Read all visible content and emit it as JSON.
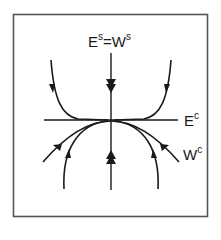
{
  "figure": {
    "type": "phase-portrait",
    "colors": {
      "stroke": "#1a1a1a",
      "frame": "#555555",
      "background": "#ffffff"
    }
  },
  "labels": {
    "stable": {
      "base": "E",
      "sup": "s",
      "eq": "=",
      "base2": "W",
      "sup2": "s"
    },
    "center_subspace": {
      "base": "E",
      "sup": "c"
    },
    "center_manifold": {
      "base": "W",
      "sup": "c"
    }
  },
  "elements": {
    "stable_axis": "vertical line (E^s = W^s), double arrows pointing toward origin",
    "center_axis": "horizontal line (E^c)",
    "center_manifold": "curve W^c tangent to E^c at origin, bending downward, arrows toward origin",
    "trajectories": [
      "upper-left",
      "upper-right",
      "lower-left",
      "lower-right"
    ]
  }
}
